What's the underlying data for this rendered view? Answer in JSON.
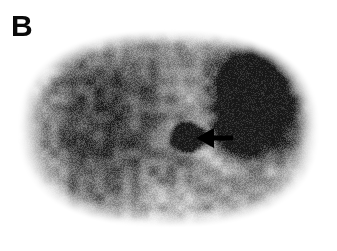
{
  "figure": {
    "panel_label": "B",
    "modality": "nuclear-medicine-axial-scan",
    "colormap": "grayscale-inverted",
    "background_color": "#ffffff",
    "label_color": "#0a0a0a",
    "annotation_color": "#000000",
    "width": 337,
    "height": 251
  },
  "image_content": {
    "body_outline": {
      "description": "rounded oval axial body cross-section",
      "center_x": 168,
      "center_y": 128,
      "radius_x": 152,
      "radius_y": 100,
      "edge_softness": 26
    },
    "noise": {
      "amount": 0.2,
      "grain": "fine-speckle"
    },
    "regions": [
      {
        "name": "liver-parenchyma",
        "cx": 112,
        "cy": 118,
        "rx": 72,
        "ry": 62,
        "intensity": 0.46,
        "softness": 0.85
      },
      {
        "name": "liver-mottle-upper",
        "cx": 104,
        "cy": 92,
        "rx": 40,
        "ry": 30,
        "intensity": 0.2,
        "softness": 0.95
      },
      {
        "name": "liver-mottle-lower",
        "cx": 100,
        "cy": 150,
        "rx": 44,
        "ry": 34,
        "intensity": 0.18,
        "softness": 0.95
      },
      {
        "name": "spleen-stomach-uptake",
        "cx": 256,
        "cy": 100,
        "rx": 44,
        "ry": 52,
        "intensity": 0.92,
        "softness": 0.55
      },
      {
        "name": "spleen-core",
        "cx": 252,
        "cy": 96,
        "rx": 28,
        "ry": 34,
        "intensity": 0.96,
        "softness": 0.45
      },
      {
        "name": "spleen-inferior-lobe",
        "cx": 238,
        "cy": 133,
        "rx": 22,
        "ry": 22,
        "intensity": 0.7,
        "softness": 0.7
      },
      {
        "name": "focal-lesion-hotspot",
        "cx": 188,
        "cy": 137,
        "rx": 15,
        "ry": 12,
        "intensity": 0.99,
        "softness": 0.3
      },
      {
        "name": "midline-vertebral-shadow",
        "cx": 176,
        "cy": 168,
        "rx": 34,
        "ry": 24,
        "intensity": 0.22,
        "softness": 0.9
      },
      {
        "name": "posterior-muscle-left",
        "cx": 96,
        "cy": 196,
        "rx": 42,
        "ry": 26,
        "intensity": 0.26,
        "softness": 0.92
      },
      {
        "name": "posterior-muscle-right",
        "cx": 238,
        "cy": 192,
        "rx": 40,
        "ry": 24,
        "intensity": 0.22,
        "softness": 0.92
      },
      {
        "name": "anterior-soft-tissue",
        "cx": 168,
        "cy": 64,
        "rx": 84,
        "ry": 26,
        "intensity": 0.18,
        "softness": 0.95
      },
      {
        "name": "right-flank-rim",
        "cx": 296,
        "cy": 150,
        "rx": 22,
        "ry": 44,
        "intensity": 0.14,
        "softness": 0.95
      }
    ],
    "arrow_annotation": {
      "name": "lesion-pointer-arrow",
      "direction": "left",
      "tip_x": 196,
      "tip_y": 138,
      "head_back_x": 214,
      "head_half_height": 10,
      "shaft_start_x": 213,
      "shaft_end_x": 233,
      "shaft_thickness": 5,
      "points_at": "focal-lesion-hotspot"
    }
  }
}
